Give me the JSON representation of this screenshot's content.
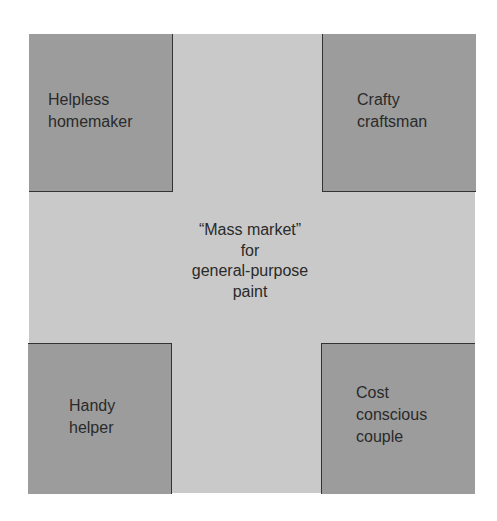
{
  "diagram": {
    "center": {
      "lines": [
        "“Mass market”",
        "for",
        "general-purpose",
        "paint"
      ]
    },
    "segments": {
      "top_left": {
        "lines": [
          "Helpless",
          "homemaker"
        ]
      },
      "top_right": {
        "lines": [
          "Crafty",
          "craftsman"
        ]
      },
      "bottom_left": {
        "lines": [
          "Handy",
          "helper"
        ]
      },
      "bottom_right": {
        "lines": [
          "Cost",
          "conscious",
          "couple"
        ]
      }
    },
    "colors": {
      "mass_market_field": "#c9c9c9",
      "segment_fill": "#9c9c9c",
      "border": "#333333",
      "text": "#2a2a2a"
    }
  }
}
